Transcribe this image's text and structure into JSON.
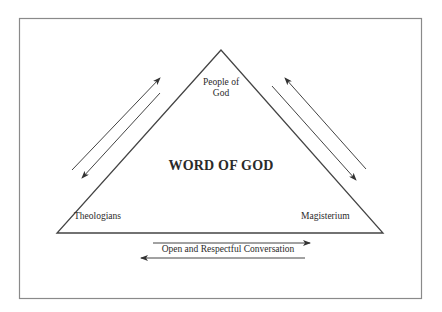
{
  "diagram": {
    "center_label": "WORD OF GOD",
    "vertices": {
      "top": "People of God",
      "top_line1": "People of",
      "top_line2": "God",
      "bottom_left": "Theologians",
      "bottom_right": "Magisterium"
    },
    "base_label": "Open and Respectful Conversation",
    "colors": {
      "line": "#444444",
      "frame": "#8a8a8a",
      "text": "#2a2a2a",
      "background": "#ffffff"
    },
    "arrows": [
      {
        "side": "left",
        "direction": "up-right"
      },
      {
        "side": "left",
        "direction": "down-left"
      },
      {
        "side": "right",
        "direction": "up-left"
      },
      {
        "side": "right",
        "direction": "down-right"
      },
      {
        "side": "bottom",
        "direction": "right"
      },
      {
        "side": "bottom",
        "direction": "left"
      }
    ]
  }
}
